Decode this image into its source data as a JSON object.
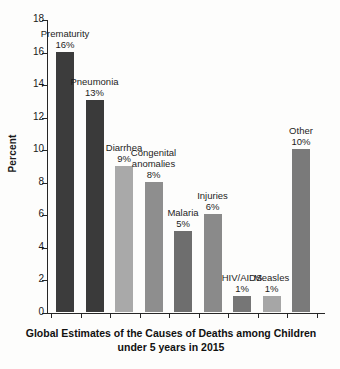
{
  "chart_data": {
    "type": "bar",
    "title": "",
    "caption_line1": "Global Estimates of the Causes of Deaths among Children",
    "caption_line2": "under 5 years in 2015",
    "xlabel": "",
    "ylabel": "Percent",
    "ylim": [
      0,
      18
    ],
    "ytick_step": 2,
    "yticks": [
      "18",
      "16",
      "14",
      "12",
      "10",
      "8",
      "6",
      "4",
      "2",
      "0"
    ],
    "grid": false,
    "legend": "none",
    "categories": [
      "Prematurity",
      "Pneumonia",
      "Diarrhea",
      "Congenital anomalies",
      "Malaria",
      "Injuries",
      "HIV/AIDS",
      "Measles",
      "Other"
    ],
    "values": [
      16,
      13,
      9,
      8,
      5,
      6,
      1,
      1,
      10
    ],
    "value_labels": [
      "16%",
      "13%",
      "9%",
      "8%",
      "5%",
      "6%",
      "1%",
      "1%",
      "10%"
    ],
    "bar_colors": [
      "#3c3c3c",
      "#3a3a3a",
      "#a9a9a9",
      "#8e8e8e",
      "#6e6e6e",
      "#8a8a8a",
      "#767676",
      "#a6a6a6",
      "#7a7a7a"
    ]
  },
  "annotations": [
    {
      "cat": "Prematurity",
      "val": "16%",
      "lines": 1
    },
    {
      "cat": "Pneumonia",
      "val": "13%",
      "lines": 1
    },
    {
      "cat": "Diarrhea",
      "val": "9%",
      "lines": 1
    },
    {
      "cat": "Congenital",
      "cat2": "anomalies",
      "val": "8%",
      "lines": 2
    },
    {
      "cat": "Malaria",
      "val": "5%",
      "lines": 1
    },
    {
      "cat": "Injuries",
      "val": "6%",
      "lines": 1
    },
    {
      "cat": "HIV/AIDS",
      "val": "1%",
      "lines": 1
    },
    {
      "cat": "Measles",
      "val": "1%",
      "lines": 1
    },
    {
      "cat": "Other",
      "val": "10%",
      "lines": 1
    }
  ]
}
